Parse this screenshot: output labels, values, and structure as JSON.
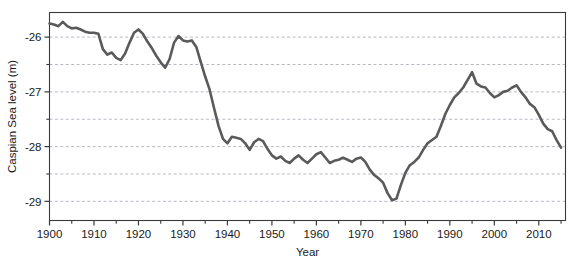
{
  "chart_data": {
    "type": "line",
    "title": "",
    "subtitle": "",
    "xlabel": "Year",
    "ylabel": "Caspian Sea level (m)",
    "xlim": [
      1900,
      2016
    ],
    "ylim": [
      -29.35,
      -25.55
    ],
    "xticks": [
      1900,
      1910,
      1920,
      1930,
      1940,
      1950,
      1960,
      1970,
      1980,
      1990,
      2000,
      2010
    ],
    "xtick_labels": [
      "1900",
      "1910",
      "1920",
      "1930",
      "1940",
      "1950",
      "1960",
      "1970",
      "1980",
      "1990",
      "2000",
      "2010"
    ],
    "xminor_tick_step": 5,
    "yticks": [
      -26,
      -27,
      -28,
      -29
    ],
    "ytick_labels": [
      "-26",
      "-27",
      "-28",
      "-29"
    ],
    "ygridlines": [
      -26,
      -26.5,
      -27,
      -27.5,
      -28,
      -28.5,
      -29
    ],
    "grid": "horizontal-dashed",
    "legend": "none",
    "line_color": "#5a5a5a",
    "line_width": 2.6,
    "axis_color": "#3a3a3a",
    "grid_color": "#b9b9c4",
    "series": [
      {
        "name": "Caspian Sea level",
        "x": [
          1900,
          1901,
          1902,
          1903,
          1904,
          1905,
          1906,
          1907,
          1908,
          1909,
          1910,
          1911,
          1912,
          1913,
          1914,
          1915,
          1916,
          1917,
          1918,
          1919,
          1920,
          1921,
          1922,
          1923,
          1924,
          1925,
          1926,
          1927,
          1928,
          1929,
          1930,
          1931,
          1932,
          1933,
          1934,
          1935,
          1936,
          1937,
          1938,
          1939,
          1940,
          1941,
          1942,
          1943,
          1944,
          1945,
          1946,
          1947,
          1948,
          1949,
          1950,
          1951,
          1952,
          1953,
          1954,
          1955,
          1956,
          1957,
          1958,
          1959,
          1960,
          1961,
          1962,
          1963,
          1964,
          1965,
          1966,
          1967,
          1968,
          1969,
          1970,
          1971,
          1972,
          1973,
          1974,
          1975,
          1976,
          1977,
          1978,
          1979,
          1980,
          1981,
          1982,
          1983,
          1984,
          1985,
          1986,
          1987,
          1988,
          1989,
          1990,
          1991,
          1992,
          1993,
          1994,
          1995,
          1996,
          1997,
          1998,
          1999,
          2000,
          2001,
          2002,
          2003,
          2004,
          2005,
          2006,
          2007,
          2008,
          2009,
          2010,
          2011,
          2012,
          2013,
          2014,
          2015
        ],
        "values": [
          -25.75,
          -25.77,
          -25.8,
          -25.72,
          -25.8,
          -25.84,
          -25.83,
          -25.86,
          -25.9,
          -25.92,
          -25.92,
          -25.94,
          -26.22,
          -26.32,
          -26.28,
          -26.38,
          -26.42,
          -26.3,
          -26.1,
          -25.92,
          -25.86,
          -25.94,
          -26.08,
          -26.2,
          -26.34,
          -26.46,
          -26.56,
          -26.4,
          -26.1,
          -25.98,
          -26.06,
          -26.08,
          -26.06,
          -26.18,
          -26.45,
          -26.72,
          -26.96,
          -27.3,
          -27.62,
          -27.86,
          -27.94,
          -27.82,
          -27.84,
          -27.86,
          -27.94,
          -28.06,
          -27.92,
          -27.86,
          -27.9,
          -28.04,
          -28.16,
          -28.22,
          -28.18,
          -28.26,
          -28.3,
          -28.22,
          -28.16,
          -28.24,
          -28.3,
          -28.22,
          -28.14,
          -28.1,
          -28.2,
          -28.3,
          -28.26,
          -28.24,
          -28.2,
          -28.24,
          -28.28,
          -28.22,
          -28.2,
          -28.28,
          -28.42,
          -28.52,
          -28.58,
          -28.66,
          -28.85,
          -28.98,
          -28.95,
          -28.7,
          -28.48,
          -28.34,
          -28.28,
          -28.2,
          -28.06,
          -27.94,
          -27.88,
          -27.82,
          -27.62,
          -27.4,
          -27.24,
          -27.1,
          -27.02,
          -26.92,
          -26.78,
          -26.64,
          -26.85,
          -26.9,
          -26.92,
          -27.02,
          -27.1,
          -27.06,
          -27.0,
          -26.98,
          -26.92,
          -26.88,
          -27.0,
          -27.1,
          -27.22,
          -27.28,
          -27.42,
          -27.58,
          -27.68,
          -27.72,
          -27.88,
          -28.02
        ]
      }
    ]
  }
}
